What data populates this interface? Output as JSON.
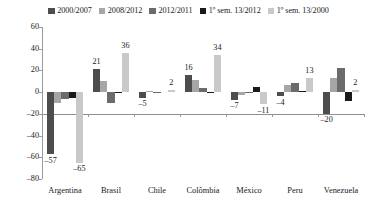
{
  "chart_data": {
    "type": "bar",
    "title": "",
    "subtitle": "",
    "xlabel": "",
    "ylabel": "",
    "ylim": [
      -80,
      60
    ],
    "ytick_step": 20,
    "yticks": [
      "60",
      "40",
      "20",
      "0",
      "-20",
      "-40",
      "-60",
      "-80"
    ],
    "grid": false,
    "legend_position": "top-center",
    "categories": [
      "Argentina",
      "Brasil",
      "Chile",
      "Colômbia",
      "México",
      "Peru",
      "Venezuela"
    ],
    "series": [
      {
        "name": "2000/2007",
        "color": "#4d4d4d",
        "values": [
          -57,
          21,
          -5,
          16,
          -7,
          -4,
          -20
        ]
      },
      {
        "name": "2008/2012",
        "color": "#a6a6a6",
        "values": [
          -10,
          10,
          1,
          11,
          -3,
          7,
          13
        ]
      },
      {
        "name": "2012/2011",
        "color": "#6b6b6b",
        "values": [
          -6,
          -10,
          -1,
          4,
          -1,
          8,
          22
        ]
      },
      {
        "name": "1º sem. 13/2012",
        "color": "#1a1a1a",
        "values": [
          -5,
          -1,
          0,
          -1,
          5,
          1,
          -8
        ]
      },
      {
        "name": "1º sem. 13/2000",
        "color": "#c9c9c9",
        "values": [
          -65,
          36,
          2,
          34,
          -11,
          13,
          2
        ]
      }
    ],
    "data_labels": [
      {
        "text": "-57",
        "category": "Argentina",
        "series": "2000/2007",
        "value": -57
      },
      {
        "text": "-65",
        "category": "Argentina",
        "series": "1º sem. 13/2000",
        "value": -65
      },
      {
        "text": "21",
        "category": "Brasil",
        "series": "2000/2007",
        "value": 21
      },
      {
        "text": "36",
        "category": "Brasil",
        "series": "1º sem. 13/2000",
        "value": 36
      },
      {
        "text": "-5",
        "category": "Chile",
        "series": "2000/2007",
        "value": -5
      },
      {
        "text": "2",
        "category": "Chile",
        "series": "1º sem. 13/2000",
        "value": 2
      },
      {
        "text": "16",
        "category": "Colômbia",
        "series": "2000/2007",
        "value": 16
      },
      {
        "text": "34",
        "category": "Colômbia",
        "series": "1º sem. 13/2000",
        "value": 34
      },
      {
        "text": "-7",
        "category": "México",
        "series": "2000/2007",
        "value": -7
      },
      {
        "text": "-11",
        "category": "México",
        "series": "1º sem. 13/2000",
        "value": -11
      },
      {
        "text": "-4",
        "category": "Peru",
        "series": "2000/2007",
        "value": -4
      },
      {
        "text": "13",
        "category": "Peru",
        "series": "1º sem. 13/2000",
        "value": 13
      },
      {
        "text": "-20",
        "category": "Venezuela",
        "series": "2000/2007",
        "value": -20
      },
      {
        "text": "2",
        "category": "Venezuela",
        "series": "1º sem. 13/2000",
        "value": 2
      }
    ]
  },
  "legend": {
    "items": [
      {
        "label": "2000/2007",
        "color": "#4d4d4d"
      },
      {
        "label": "2008/2012",
        "color": "#a6a6a6"
      },
      {
        "label": "2012/2011",
        "color": "#6b6b6b"
      },
      {
        "label": "1º sem. 13/2012",
        "color": "#1a1a1a"
      },
      {
        "label": "1º sem. 13/2000",
        "color": "#c9c9c9"
      }
    ]
  },
  "axes": {
    "y_tick_labels": [
      "60",
      "40",
      "20",
      "0",
      "-20",
      "-40",
      "-60",
      "-80"
    ],
    "x_tick_labels": [
      "Argentina",
      "Brasil",
      "Chile",
      "Colômbia",
      "México",
      "Peru",
      "Venezuela"
    ]
  }
}
